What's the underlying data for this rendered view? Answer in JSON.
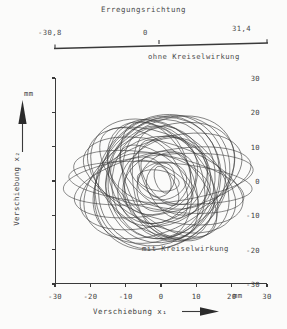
{
  "figure": {
    "excitation_title": "Erregungsrichtung",
    "excitation_scale": {
      "left_value": "-30,8",
      "center_value": "0",
      "right_value": "31,4"
    },
    "annotation_without": "ohne Kreiselwirkung",
    "annotation_with": "mit Kreiselwirkung",
    "ink_color": "#3a3a3a",
    "background_color": "#fbfbfa"
  },
  "chart_data": {
    "type": "line",
    "title": "Erregungsrichtung",
    "xlabel": "Verschiebung  x₁",
    "ylabel": "Verschiebung  x₂",
    "xunit": "mm",
    "yunit": "mm",
    "xlim": [
      -30,
      30
    ],
    "ylim": [
      -30,
      30
    ],
    "xticks": [
      -30,
      -20,
      -10,
      0,
      10,
      20,
      30
    ],
    "xticklabels": [
      "-30",
      "-20",
      "-10",
      "0",
      "10",
      "20",
      "30"
    ],
    "yticks": [
      -30,
      -20,
      -10,
      0,
      10,
      20,
      30
    ],
    "yticklabels": [
      "-30",
      "-20",
      "-10",
      "0",
      "10",
      "20",
      "30"
    ],
    "grid": false,
    "legend": false,
    "annotations": [
      {
        "text": "ohne Kreiselwirkung",
        "x": 6,
        "y": 35
      },
      {
        "text": "mit Kreiselwirkung",
        "x": 7,
        "y": -23
      }
    ],
    "series": [
      {
        "name": "orbit",
        "rx": 27.0,
        "ry": 7.0,
        "angle": 6
      },
      {
        "name": "orbit",
        "rx": 26.0,
        "ry": 6.0,
        "angle": -4
      },
      {
        "name": "orbit",
        "rx": 25.5,
        "ry": 9.0,
        "angle": 12
      },
      {
        "name": "orbit",
        "rx": 24.5,
        "ry": 8.0,
        "angle": -11
      },
      {
        "name": "orbit",
        "rx": 24.0,
        "ry": 12.0,
        "angle": 20
      },
      {
        "name": "orbit",
        "rx": 23.5,
        "ry": 11.0,
        "angle": -18
      },
      {
        "name": "orbit",
        "rx": 23.0,
        "ry": 14.5,
        "angle": 28
      },
      {
        "name": "orbit",
        "rx": 22.5,
        "ry": 13.0,
        "angle": -26
      },
      {
        "name": "orbit",
        "rx": 22.0,
        "ry": 16.0,
        "angle": 36
      },
      {
        "name": "orbit",
        "rx": 21.5,
        "ry": 15.0,
        "angle": -34
      },
      {
        "name": "orbit",
        "rx": 21.0,
        "ry": 17.5,
        "angle": 44
      },
      {
        "name": "orbit",
        "rx": 20.5,
        "ry": 10.0,
        "angle": -42
      },
      {
        "name": "orbit",
        "rx": 20.0,
        "ry": 18.0,
        "angle": 52
      },
      {
        "name": "orbit",
        "rx": 19.5,
        "ry": 12.5,
        "angle": -50
      },
      {
        "name": "orbit",
        "rx": 19.0,
        "ry": 17.0,
        "angle": 60
      },
      {
        "name": "orbit",
        "rx": 18.5,
        "ry": 14.0,
        "angle": -58
      },
      {
        "name": "orbit",
        "rx": 18.0,
        "ry": 16.5,
        "angle": 68
      },
      {
        "name": "orbit",
        "rx": 17.5,
        "ry": 9.5,
        "angle": -66
      },
      {
        "name": "orbit",
        "rx": 17.0,
        "ry": 15.5,
        "angle": 76
      },
      {
        "name": "orbit",
        "rx": 16.5,
        "ry": 11.5,
        "angle": -74
      },
      {
        "name": "orbit",
        "rx": 16.0,
        "ry": 14.0,
        "angle": 84
      },
      {
        "name": "orbit",
        "rx": 15.5,
        "ry": 8.5,
        "angle": -82
      },
      {
        "name": "orbit",
        "rx": 15.0,
        "ry": 13.0,
        "angle": 15
      },
      {
        "name": "orbit",
        "rx": 14.5,
        "ry": 7.5,
        "angle": -15
      },
      {
        "name": "orbit",
        "rx": 14.0,
        "ry": 11.0,
        "angle": 40
      },
      {
        "name": "orbit",
        "rx": 13.5,
        "ry": 6.5,
        "angle": -40
      },
      {
        "name": "orbit",
        "rx": 13.0,
        "ry": 10.0,
        "angle": 65
      },
      {
        "name": "orbit",
        "rx": 12.0,
        "ry": 5.5,
        "angle": -65
      },
      {
        "name": "orbit",
        "rx": 11.0,
        "ry": 8.5,
        "angle": 30
      },
      {
        "name": "orbit",
        "rx": 10.0,
        "ry": 4.5,
        "angle": -30
      },
      {
        "name": "orbit",
        "rx": 9.0,
        "ry": 7.0,
        "angle": 55
      },
      {
        "name": "orbit",
        "rx": 8.0,
        "ry": 3.5,
        "angle": -55
      },
      {
        "name": "orbit",
        "rx": 7.0,
        "ry": 5.5,
        "angle": 10
      },
      {
        "name": "orbit",
        "rx": 6.0,
        "ry": 3.0,
        "angle": -10
      },
      {
        "name": "orbit",
        "rx": 5.0,
        "ry": 4.0,
        "angle": 70
      },
      {
        "name": "orbit",
        "rx": 4.0,
        "ry": 2.2,
        "angle": -70
      }
    ]
  }
}
